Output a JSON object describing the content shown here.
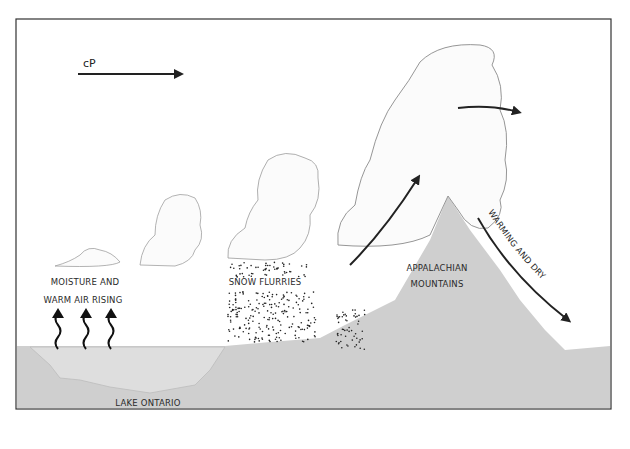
{
  "diagram": {
    "type": "lake-effect snow cross-section",
    "air_mass_label": "cP",
    "labels": {
      "moisture_line1": "MOISTURE AND",
      "moisture_line2": "WARM AIR RISING",
      "snow": "SNOW FLURRIES",
      "mountains_line1": "APPALACHIAN",
      "mountains_line2": "MOUNTAINS",
      "descent": "WARMING AND DRY",
      "lake": "LAKE ONTARIO"
    },
    "colors": {
      "ground": "#cfcfcf",
      "lake": "#dcdcdc",
      "frame": "#333333",
      "arrow": "#222222",
      "cloud_outline": "#9a9a9a"
    },
    "rising_arrows_count": 3
  }
}
